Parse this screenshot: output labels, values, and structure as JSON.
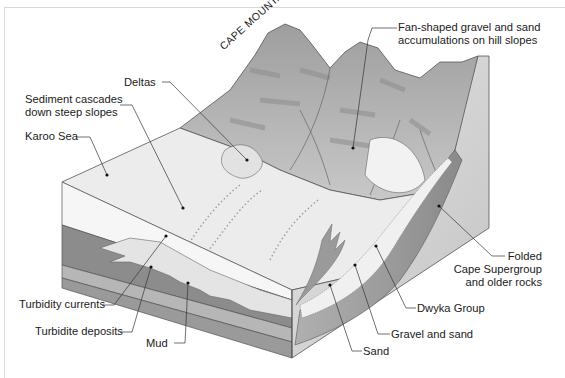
{
  "diagram": {
    "title_on_image": "CAPE MOUNTAINS",
    "colors": {
      "background": "#ffffff",
      "sea_surface": "#ececec",
      "water_column": "#f4f4f4",
      "mud_layer": "#8a8a8a",
      "turbidite": "#e6e6e6",
      "mid_layer": "#b4b4b4",
      "base_layer": "#9c9c9c",
      "mountain": "#b8b8b8",
      "cape_rocks": "#d4d4d4",
      "dwyka": "#a8a8a8",
      "leader_line": "#333333"
    },
    "labels": {
      "fan_shaped_line1": "Fan-shaped gravel and sand",
      "fan_shaped_line2": "accumulations on hill slopes",
      "deltas": "Deltas",
      "sediment_line1": "Sediment cascades",
      "sediment_line2": "down steep slopes",
      "karoo_sea": "Karoo Sea",
      "turbidity_currents": "Turbidity currents",
      "turbidite_deposits": "Turbidite deposits",
      "mud": "Mud",
      "sand": "Sand",
      "gravel_and_sand": "Gravel and sand",
      "dwyka_group": "Dwyka Group",
      "folded_line1": "Folded",
      "folded_line2": "Cape Supergroup",
      "folded_line3": "and older rocks"
    }
  }
}
